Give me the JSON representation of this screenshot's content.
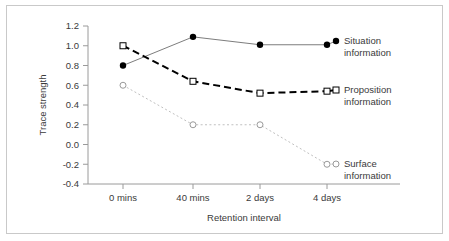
{
  "chart_data": {
    "type": "line",
    "title": "",
    "xlabel": "Retention interval",
    "ylabel": "Trace strength",
    "categories": [
      "0 mins",
      "40 mins",
      "2 days",
      "4 days"
    ],
    "ylim": [
      -0.4,
      1.2
    ],
    "yticks": [
      "1.2",
      "1.0",
      "0.8",
      "0.6",
      "0.4",
      "0.2",
      "0.0",
      "-0.2",
      "-0.4"
    ],
    "ytick_values": [
      1.2,
      1.0,
      0.8,
      0.6,
      0.4,
      0.2,
      0.0,
      -0.2,
      -0.4
    ],
    "grid": false,
    "legend_position": "right-inline",
    "series": [
      {
        "name": "Situation information",
        "label_line1": "Situation",
        "label_line2": "information",
        "values": [
          0.8,
          1.09,
          1.01,
          1.01
        ],
        "marker": "filled-circle",
        "line_style": "solid",
        "color": "#7d7d7d",
        "marker_color": "#000000"
      },
      {
        "name": "Proposition information",
        "label_line1": "Proposition",
        "label_line2": "information",
        "values": [
          1.0,
          0.64,
          0.52,
          0.54
        ],
        "marker": "open-square",
        "line_style": "dashed",
        "color": "#000000",
        "marker_color": "#000000"
      },
      {
        "name": "Surface information",
        "label_line1": "Surface",
        "label_line2": "information",
        "values": [
          0.6,
          0.2,
          0.2,
          -0.2
        ],
        "marker": "open-circle",
        "line_style": "dotted",
        "color": "#c0c0c0",
        "marker_color": "#9a9a9a"
      }
    ]
  },
  "colors": {
    "border": "#c9c9c9",
    "axis": "#9a9a9a",
    "text": "#3a3a3a",
    "background": "#ffffff"
  }
}
